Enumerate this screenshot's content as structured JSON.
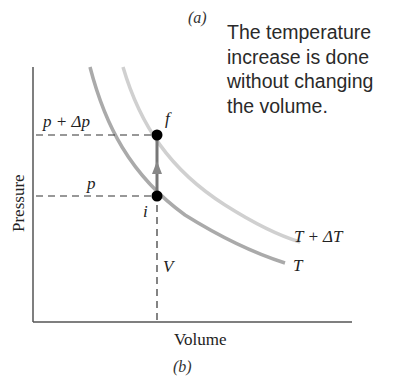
{
  "panel_labels": {
    "top": "(a)",
    "bottom": "(b)"
  },
  "note": {
    "lines": [
      "The temperature",
      "increase is done",
      "without changing",
      "the volume."
    ]
  },
  "axes": {
    "xlabel": "Volume",
    "ylabel": "Pressure"
  },
  "levels": {
    "p_final_label": "p + Δp",
    "p_initial_label": "p",
    "volume_label": "V"
  },
  "points": {
    "initial": "i",
    "final": "f"
  },
  "isotherms": {
    "lower": "T",
    "upper": "T + ΔT"
  },
  "colors": {
    "axis": "#555555",
    "isotherm_T": "#a8a8a8",
    "isotherm_TdT": "#cfcfcf",
    "process_arrow": "#777777",
    "point": "#000000",
    "dashed": "#333333"
  }
}
